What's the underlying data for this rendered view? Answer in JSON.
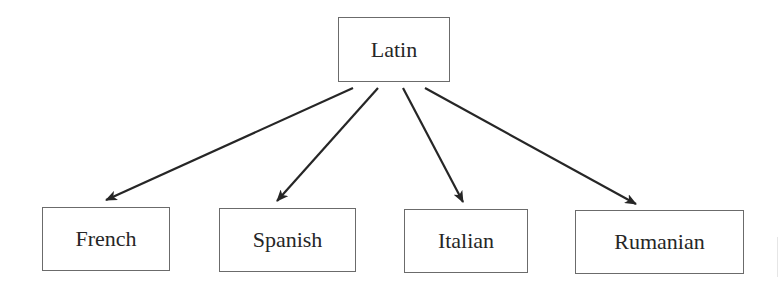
{
  "diagram": {
    "type": "tree",
    "root": {
      "id": "latin",
      "label": "Latin",
      "box": [
        338,
        17,
        112,
        65
      ]
    },
    "children": [
      {
        "id": "french",
        "label": "French",
        "box": [
          42,
          207,
          128,
          64
        ]
      },
      {
        "id": "spanish",
        "label": "Spanish",
        "box": [
          219,
          208,
          137,
          64
        ]
      },
      {
        "id": "italian",
        "label": "Italian",
        "box": [
          404,
          209,
          124,
          64
        ]
      },
      {
        "id": "rumanian",
        "label": "Rumanian",
        "box": [
          575,
          210,
          169,
          64
        ]
      }
    ],
    "edges": [
      {
        "from": "latin",
        "to": "french",
        "x1": 353,
        "y1": 88,
        "x2": 106,
        "y2": 200
      },
      {
        "from": "latin",
        "to": "spanish",
        "x1": 378,
        "y1": 88,
        "x2": 277,
        "y2": 201
      },
      {
        "from": "latin",
        "to": "italian",
        "x1": 403,
        "y1": 88,
        "x2": 463,
        "y2": 202
      },
      {
        "from": "latin",
        "to": "rumanian",
        "x1": 425,
        "y1": 88,
        "x2": 636,
        "y2": 204
      }
    ],
    "colors": {
      "line": "#262626",
      "border": "#6b6b6b",
      "text": "#262626"
    }
  }
}
